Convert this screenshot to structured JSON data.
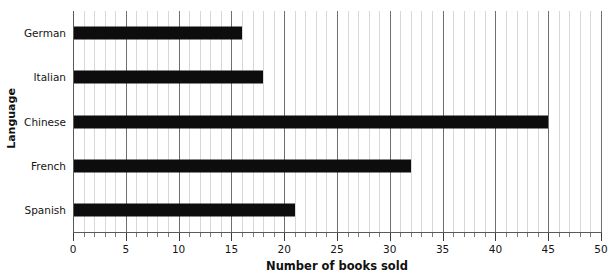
{
  "chart_data": {
    "type": "bar",
    "orientation": "horizontal",
    "title": "",
    "xlabel": "Number of books sold",
    "ylabel": "Language",
    "categories": [
      "German",
      "Italian",
      "Chinese",
      "French",
      "Spanish"
    ],
    "values": [
      16,
      18,
      45,
      32,
      21
    ],
    "series": [
      {
        "name": "Number of books sold",
        "values": [
          16,
          18,
          45,
          32,
          21
        ]
      }
    ],
    "xlim": [
      0,
      50
    ],
    "xticks": [
      0,
      5,
      10,
      15,
      20,
      25,
      30,
      35,
      40,
      45,
      50
    ],
    "xtick_labels": [
      "0",
      "5",
      "10",
      "15",
      "20",
      "25",
      "30",
      "35",
      "40",
      "45",
      "50"
    ],
    "minor_tick_step": 1,
    "grid": {
      "vertical_major": true,
      "vertical_minor": true,
      "horizontal": false
    },
    "legend": null,
    "colors": {
      "bar": "#0d0d0d",
      "grid_major": "#6f6f6f",
      "grid_minor": "#d8d8d8",
      "axis": "#5a5a5a",
      "background": "#ffffff",
      "text": "#151515"
    }
  }
}
